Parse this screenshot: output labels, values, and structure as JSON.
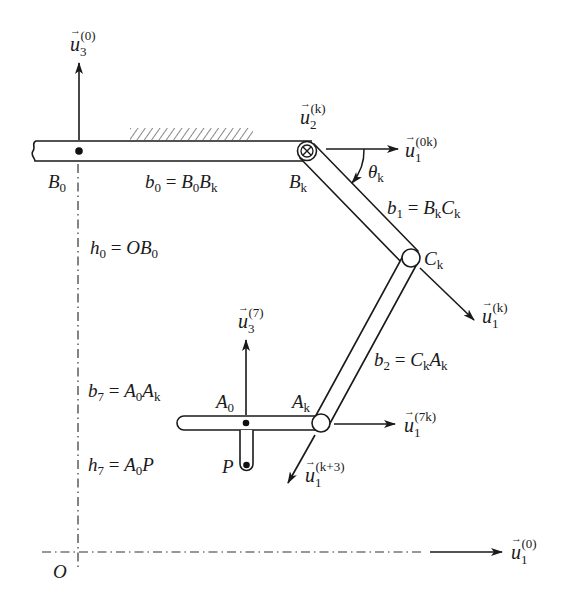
{
  "figure": {
    "colors": {
      "ink": "#1a1a1a",
      "background": "#ffffff",
      "hatch": "#555555"
    }
  },
  "points": {
    "B0": {
      "label": "B",
      "sub": "0"
    },
    "Bk": {
      "label": "B",
      "sub": "k"
    },
    "Ck": {
      "label": "C",
      "sub": "k"
    },
    "Ak": {
      "label": "A",
      "sub": "k"
    },
    "A0": {
      "label": "A",
      "sub": "0"
    },
    "P": {
      "label": "P"
    },
    "O": {
      "label": "O"
    }
  },
  "vectors": {
    "u3_0": {
      "base": "u",
      "sub": "3",
      "sup": "(0)"
    },
    "u2_k": {
      "base": "u",
      "sub": "2",
      "sup": "(k)"
    },
    "u1_0k": {
      "base": "u",
      "sub": "1",
      "sup": "(0k)"
    },
    "u1_k": {
      "base": "u",
      "sub": "1",
      "sup": "(k)"
    },
    "u3_7": {
      "base": "u",
      "sub": "3",
      "sup": "(7)"
    },
    "u1_7k": {
      "base": "u",
      "sub": "1",
      "sup": "(7k)"
    },
    "u1_k3": {
      "base": "u",
      "sub": "1",
      "sup": "(k+3)"
    },
    "u1_0": {
      "base": "u",
      "sub": "1",
      "sup": "(0)"
    }
  },
  "equations": {
    "b0": {
      "lhs": "b",
      "lhs_sub": "0",
      "eq": " = ",
      "r1": "B",
      "r1_sub": "0",
      "r2": "B",
      "r2_sub": "k"
    },
    "b1": {
      "lhs": "b",
      "lhs_sub": "1",
      "eq": " = ",
      "r1": "B",
      "r1_sub": "k",
      "r2": "C",
      "r2_sub": "k"
    },
    "b2": {
      "lhs": "b",
      "lhs_sub": "2",
      "eq": " = ",
      "r1": "C",
      "r1_sub": "k",
      "r2": "A",
      "r2_sub": "k"
    },
    "h0": {
      "lhs": "h",
      "lhs_sub": "0",
      "eq": " = ",
      "r1": "O",
      "r1_sub": "",
      "r2": "B",
      "r2_sub": "0"
    },
    "b7": {
      "lhs": "b",
      "lhs_sub": "7",
      "eq": " = ",
      "r1": "A",
      "r1_sub": "0",
      "r2": "A",
      "r2_sub": "k"
    },
    "h7": {
      "lhs": "h",
      "lhs_sub": "7",
      "eq": " = ",
      "r1": "A",
      "r1_sub": "0",
      "r2": "P",
      "r2_sub": ""
    }
  },
  "angle": {
    "symbol": "θ",
    "sub": "k"
  },
  "vector_arrow_glyph": "→"
}
